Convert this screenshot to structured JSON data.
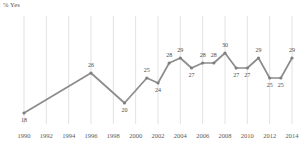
{
  "chart_data": {
    "type": "line",
    "title": "",
    "ylabel": "% Yes",
    "xlabel": "",
    "grid": "vertical",
    "legend": "none",
    "xlim": [
      1990,
      2014
    ],
    "ylim": [
      0,
      34
    ],
    "x": [
      1990,
      1996,
      1999,
      2001,
      2002,
      2003,
      2004,
      2005,
      2006,
      2007,
      2008,
      2009,
      2010,
      2011,
      2012,
      2013,
      2014
    ],
    "values": [
      18,
      26,
      20,
      25,
      24,
      28,
      29,
      27,
      28,
      28,
      30,
      27,
      27,
      29,
      25,
      25,
      29
    ],
    "point_labels": [
      "18",
      "26",
      "20",
      "25",
      "24",
      "28",
      "29",
      "27",
      "28",
      "28",
      "30",
      "27",
      "27",
      "29",
      "25",
      "25",
      "29"
    ],
    "tick_labels": [
      "1990",
      "1992",
      "1994",
      "1996",
      "1998",
      "2000",
      "2002",
      "2004",
      "2006",
      "2008",
      "2010",
      "2012",
      "2014"
    ],
    "tick_values": [
      1990,
      1992,
      1994,
      1996,
      1998,
      2000,
      2002,
      2004,
      2006,
      2008,
      2010,
      2012,
      2014
    ],
    "colors": {
      "line": "#8c8c8c",
      "marker": "#7f7f7f",
      "gridline": "#e2e2e2",
      "axis": "#bfbfbf",
      "label_text": "#4a4a4a",
      "tick_text": "#5a5a5a"
    }
  }
}
